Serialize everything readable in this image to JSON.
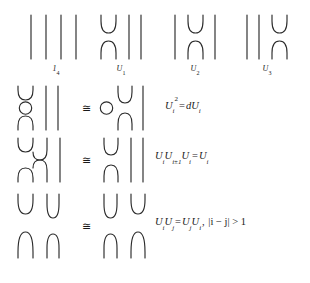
{
  "figure": {
    "kind": "temperley-lieb-generators-and-relations",
    "stroke_color": "#2b2b2b",
    "background_color": "#ffffff"
  },
  "generators": [
    {
      "id": "identity",
      "caption_main": "1",
      "caption_sub": "4",
      "strands": 4,
      "type": "identity",
      "cup_index": null
    },
    {
      "id": "U1",
      "caption_main": "U",
      "caption_sub": "1",
      "strands": 4,
      "type": "generator",
      "cup_index": 1
    },
    {
      "id": "U2",
      "caption_main": "U",
      "caption_sub": "2",
      "strands": 4,
      "type": "generator",
      "cup_index": 2
    },
    {
      "id": "U3",
      "caption_main": "U",
      "caption_sub": "3",
      "strands": 4,
      "type": "generator",
      "cup_index": 3
    }
  ],
  "relations": [
    {
      "id": "relation-idempotent",
      "congruence_symbol": "≅",
      "lhs_description": "cup, free circle, cap with two vertical strands",
      "rhs_description": "free circle beside U1 diagram",
      "equation": {
        "lhs": {
          "base": "U",
          "sub": "i",
          "sup": "2"
        },
        "operator": "=",
        "rhs": {
          "coefficient": "d",
          "base": "U",
          "sub": "i"
        },
        "plain_text": "U_i^2 = dU_i"
      }
    },
    {
      "id": "relation-braid-like",
      "congruence_symbol": "≅",
      "lhs_description": "zigzag of U1 U2 U1",
      "rhs_description": "U1 diagram",
      "equation": {
        "terms": [
          {
            "base": "U",
            "sub": "i"
          },
          {
            "base": "U",
            "sub": "i±1"
          },
          {
            "base": "U",
            "sub": "i"
          }
        ],
        "operator": "=",
        "rhs": {
          "base": "U",
          "sub": "i"
        },
        "plain_text": "U_iU_{i±1}U_i = U_i"
      }
    },
    {
      "id": "relation-commuting",
      "congruence_symbol": "≅",
      "lhs_description": "U1 stacked with U3",
      "rhs_description": "U3 stacked with U1",
      "equation": {
        "lhs_terms": [
          {
            "base": "U",
            "sub": "i"
          },
          {
            "base": "U",
            "sub": "j"
          }
        ],
        "operator": "=",
        "rhs_terms": [
          {
            "base": "U",
            "sub": "j"
          },
          {
            "base": "U",
            "sub": "i"
          }
        ],
        "condition": "|i − j| > 1",
        "plain_text": "U_iU_j = U_jU_i,  |i-j| > 1"
      }
    }
  ]
}
